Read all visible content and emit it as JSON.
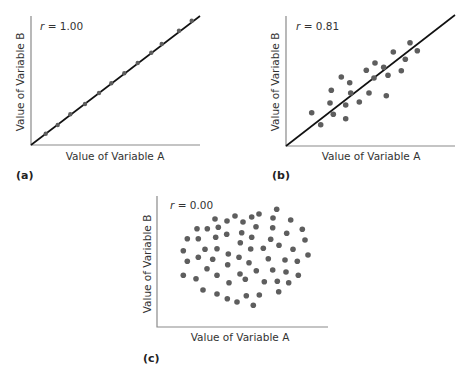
{
  "chart_data": [
    {
      "type": "scatter",
      "panel_label": "(a)",
      "annotation": "r = 1.00",
      "r_symbol": "r",
      "r_value": "= 1.00",
      "xlabel": "Value of Variable A",
      "ylabel": "Value of Variable B",
      "fit_line": true,
      "frame": {
        "x0": 31,
        "y0": 145,
        "x1": 200,
        "ytop": 16
      },
      "line": [
        [
          31,
          145
        ],
        [
          200,
          16
        ]
      ],
      "points": [
        [
          45.7,
          133.7
        ],
        [
          57.7,
          125
        ],
        [
          70.3,
          114.3
        ],
        [
          85,
          104
        ],
        [
          99,
          93
        ],
        [
          111.3,
          83.3
        ],
        [
          124.3,
          73.3
        ],
        [
          137.7,
          63
        ],
        [
          151.3,
          52.7
        ],
        [
          161.7,
          44
        ],
        [
          179,
          30.7
        ],
        [
          191.7,
          20.7
        ]
      ],
      "label_pos": {
        "r": [
          40,
          30
        ],
        "xlabel": [
          115,
          160
        ],
        "ylabel": [
          24,
          82
        ],
        "panel": [
          16,
          179
        ]
      },
      "point_radius": 2.2
    },
    {
      "type": "scatter",
      "panel_label": "(b)",
      "annotation": "r = 0.81",
      "r_symbol": "r",
      "r_value": "= 0.81",
      "xlabel": "Value of Variable A",
      "ylabel": "Value of Variable B",
      "fit_line": true,
      "frame": {
        "x0": 286,
        "y0": 146,
        "x1": 455,
        "ytop": 16
      },
      "line": [
        [
          286,
          146
        ],
        [
          455,
          15
        ]
      ],
      "points": [
        [
          410,
          42.7
        ],
        [
          417.3,
          50.7
        ],
        [
          393.3,
          52
        ],
        [
          405.3,
          59.3
        ],
        [
          375,
          63
        ],
        [
          366.3,
          70.3
        ],
        [
          383.7,
          67.3
        ],
        [
          401.3,
          70.7
        ],
        [
          388,
          75.3
        ],
        [
          374,
          78
        ],
        [
          341.3,
          77
        ],
        [
          349.7,
          82.7
        ],
        [
          331.3,
          90.3
        ],
        [
          350.7,
          93
        ],
        [
          369,
          93
        ],
        [
          386.3,
          95.7
        ],
        [
          330,
          103
        ],
        [
          359.3,
          102
        ],
        [
          345.7,
          105
        ],
        [
          311.7,
          112.7
        ],
        [
          333.3,
          114.3
        ],
        [
          345.7,
          118.7
        ],
        [
          320.7,
          124.7
        ]
      ],
      "label_pos": {
        "r": [
          296,
          30
        ],
        "xlabel": [
          371,
          160
        ],
        "ylabel": [
          279,
          82
        ],
        "panel": [
          272,
          179
        ]
      },
      "point_radius": 2.8
    },
    {
      "type": "scatter",
      "panel_label": "(c)",
      "annotation": "r = 0.00",
      "r_symbol": "r",
      "r_value": "= 0.00",
      "xlabel": "Value of Variable A",
      "ylabel": "Value of Variable B",
      "fit_line": false,
      "frame": {
        "x0": 157,
        "y0": 327,
        "x1": 328,
        "ytop": 196
      },
      "line": null,
      "points": [
        [
          276.7,
          209.3
        ],
        [
          215,
          219
        ],
        [
          227,
          221
        ],
        [
          235,
          216
        ],
        [
          243,
          222
        ],
        [
          251.7,
          217
        ],
        [
          259,
          214
        ],
        [
          273,
          218
        ],
        [
          290.7,
          220
        ],
        [
          197,
          228.7
        ],
        [
          207.3,
          228.7
        ],
        [
          218.3,
          227.3
        ],
        [
          256,
          226.7
        ],
        [
          272.7,
          227.7
        ],
        [
          302.3,
          229.3
        ],
        [
          187.3,
          238.7
        ],
        [
          198.3,
          238.7
        ],
        [
          215.7,
          237.3
        ],
        [
          226.7,
          234.3
        ],
        [
          241.7,
          232.7
        ],
        [
          251.7,
          237.3
        ],
        [
          286.7,
          233.3
        ],
        [
          305,
          240
        ],
        [
          270.7,
          239.3
        ],
        [
          240.3,
          242.7
        ],
        [
          183.3,
          250.7
        ],
        [
          205,
          249.3
        ],
        [
          217,
          248.7
        ],
        [
          250.7,
          249
        ],
        [
          263.3,
          248.3
        ],
        [
          279,
          245.3
        ],
        [
          293,
          249.3
        ],
        [
          187.3,
          261.3
        ],
        [
          198.3,
          257.3
        ],
        [
          212.7,
          259.3
        ],
        [
          228.3,
          254
        ],
        [
          239,
          257.3
        ],
        [
          249,
          262.7
        ],
        [
          268.3,
          258.7
        ],
        [
          285,
          260
        ],
        [
          297.3,
          261.3
        ],
        [
          308,
          255
        ],
        [
          207,
          268.7
        ],
        [
          227.7,
          264.7
        ],
        [
          256.3,
          270.7
        ],
        [
          272.7,
          270
        ],
        [
          286,
          272
        ],
        [
          183.3,
          275.3
        ],
        [
          196,
          278.7
        ],
        [
          217,
          275.3
        ],
        [
          240,
          274
        ],
        [
          245.3,
          279.3
        ],
        [
          264.3,
          281.7
        ],
        [
          277.3,
          281.3
        ],
        [
          288.7,
          282.7
        ],
        [
          298.3,
          275.3
        ],
        [
          229,
          282.7
        ],
        [
          203,
          290
        ],
        [
          217,
          294
        ],
        [
          227.3,
          298.7
        ],
        [
          237,
          302
        ],
        [
          246.3,
          295.7
        ],
        [
          259.3,
          295
        ],
        [
          278.7,
          291.7
        ],
        [
          253.3,
          305.3
        ]
      ],
      "label_pos": {
        "r": [
          170,
          209
        ],
        "xlabel": [
          240,
          341
        ],
        "ylabel": [
          151,
          264
        ],
        "panel": [
          143,
          362
        ]
      },
      "point_radius": 2.8
    }
  ],
  "colors": {
    "point": "#5e5e5e",
    "axis": "#8a8a8a",
    "fit_line": "#111111",
    "text": "#333333"
  }
}
